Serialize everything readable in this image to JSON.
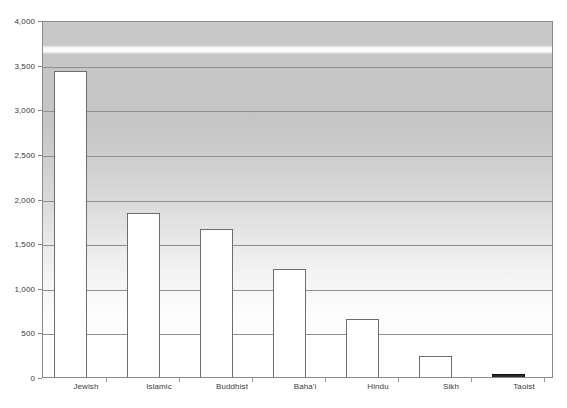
{
  "chart_data": {
    "type": "bar",
    "title": "",
    "subtitle": "",
    "xlabel": "",
    "ylabel": "",
    "categories": [
      "Jewish",
      "Islamic",
      "Buddhist",
      "Baha'i",
      "Hindu",
      "Sikh",
      "Taoist"
    ],
    "values": [
      3430,
      1840,
      1660,
      1210,
      650,
      230,
      25
    ],
    "ylim": [
      0,
      4000
    ],
    "ytick_labels": [
      "0",
      "500",
      "1,000",
      "1,500",
      "2,000",
      "2,500",
      "3,000",
      "3,500",
      "4,000"
    ],
    "ytick_values": [
      0,
      500,
      1000,
      1500,
      2000,
      2500,
      3000,
      3500,
      4000
    ],
    "grid": true,
    "grid_axis": "y",
    "legend": false,
    "legend_position": "none",
    "bar_fill_color": "#ffffff",
    "bar_border_color": "#6d6d6d",
    "plot_border_color": "#8a8a8a",
    "gridline_color": "#8f8f8f",
    "axis_text_color": "#3a3a3a",
    "plot_background": "vertical-gradient-gray-to-white"
  }
}
